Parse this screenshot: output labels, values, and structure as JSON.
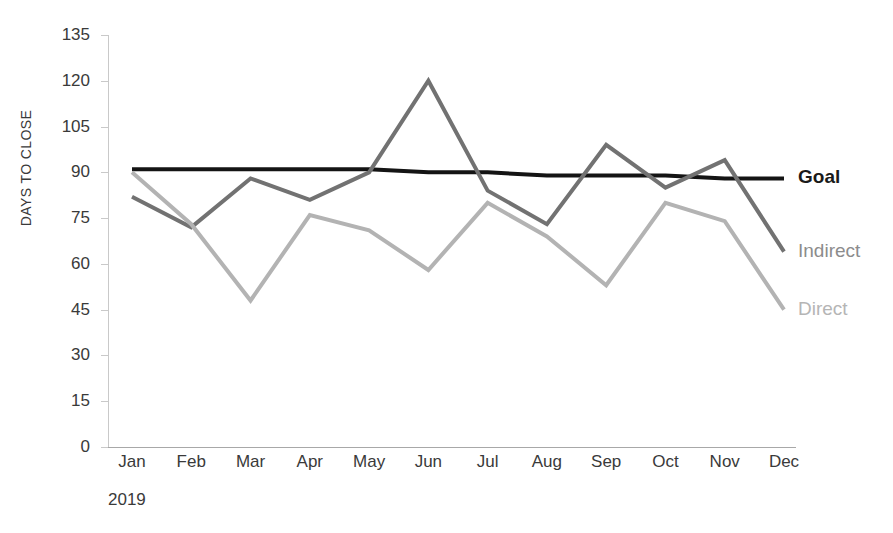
{
  "chart_data": {
    "type": "line",
    "title": "Time to close deal",
    "subtitle": "",
    "xlabel": "2019",
    "ylabel": "DAYS TO CLOSE",
    "categories": [
      "Jan",
      "Feb",
      "Mar",
      "Apr",
      "May",
      "Jun",
      "Jul",
      "Aug",
      "Sep",
      "Oct",
      "Nov",
      "Dec"
    ],
    "ylim": [
      0,
      135
    ],
    "yticks": [
      0,
      15,
      30,
      45,
      60,
      75,
      90,
      105,
      120,
      135
    ],
    "grid": false,
    "legend_position": "right-end-of-line",
    "series": [
      {
        "name": "Goal",
        "color": "#141414",
        "width": 4,
        "values": [
          91,
          91,
          91,
          91,
          91,
          90,
          90,
          89,
          89,
          89,
          88,
          88
        ]
      },
      {
        "name": "Indirect",
        "color": "#727272",
        "width": 4,
        "values": [
          82,
          72,
          88,
          81,
          90,
          120,
          84,
          73,
          99,
          85,
          94,
          64
        ]
      },
      {
        "name": "Direct",
        "color": "#b3b3b3",
        "width": 4,
        "values": [
          90,
          73,
          48,
          76,
          71,
          58,
          80,
          69,
          53,
          80,
          74,
          45
        ]
      }
    ]
  },
  "axis": {
    "y_title": "DAYS TO CLOSE",
    "x_group_label": "2019"
  },
  "labels": {
    "goal": "Goal",
    "indirect": "Indirect",
    "direct": "Direct"
  }
}
